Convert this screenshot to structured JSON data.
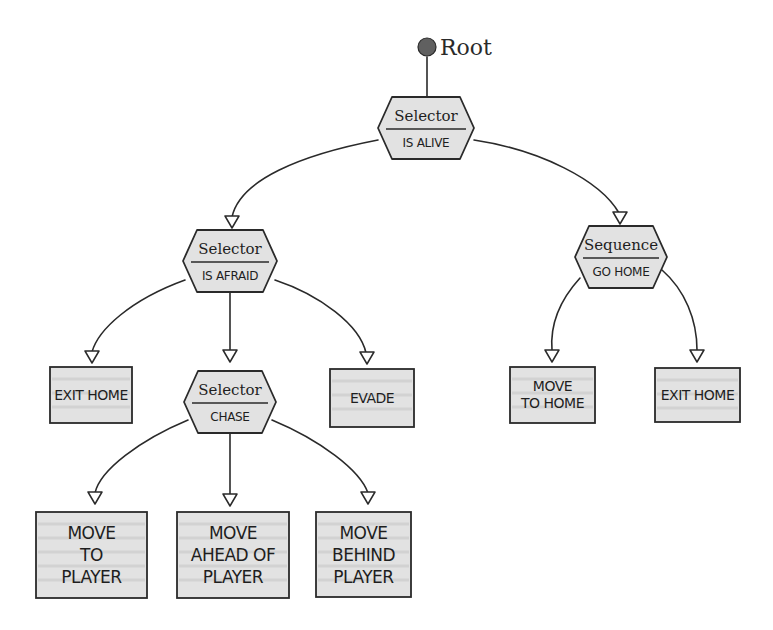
{
  "diagram": {
    "root": {
      "label": "Root",
      "x": 427,
      "y": 47
    },
    "colors": {
      "node_fill": "#e2e2e2",
      "stroke": "#2a2a2a",
      "root_dot": "#606060",
      "background": "#ffffff"
    },
    "nodes": [
      {
        "id": "n_alive",
        "shape": "hexagon",
        "type": "Selector",
        "condition": "IS ALIVE",
        "cx": 426,
        "cy": 128,
        "w": 96,
        "h": 62
      },
      {
        "id": "n_afraid",
        "shape": "hexagon",
        "type": "Selector",
        "condition": "IS AFRAID",
        "cx": 230,
        "cy": 261,
        "w": 94,
        "h": 62
      },
      {
        "id": "n_gohome",
        "shape": "hexagon",
        "type": "Sequence",
        "condition": "GO HOME",
        "cx": 621,
        "cy": 257,
        "w": 92,
        "h": 62
      },
      {
        "id": "n_exithome_l",
        "shape": "box",
        "lines": [
          "EXIT HOME"
        ],
        "x": 50,
        "y": 367,
        "w": 82,
        "h": 56,
        "size": "small"
      },
      {
        "id": "n_chase",
        "shape": "hexagon",
        "type": "Selector",
        "condition": "CHASE",
        "cx": 230,
        "cy": 402,
        "w": 92,
        "h": 62
      },
      {
        "id": "n_evade",
        "shape": "box",
        "lines": [
          "EVADE"
        ],
        "x": 330,
        "y": 369,
        "w": 84,
        "h": 58,
        "size": "small"
      },
      {
        "id": "n_movetohome",
        "shape": "box",
        "lines": [
          "MOVE",
          "TO HOME"
        ],
        "x": 510,
        "y": 367,
        "w": 85,
        "h": 56,
        "size": "small"
      },
      {
        "id": "n_exithome_r",
        "shape": "box",
        "lines": [
          "EXIT HOME"
        ],
        "x": 655,
        "y": 368,
        "w": 85,
        "h": 54,
        "size": "small"
      },
      {
        "id": "n_movetoplayer",
        "shape": "box",
        "lines": [
          "MOVE",
          "TO",
          "PLAYER"
        ],
        "x": 36,
        "y": 512,
        "w": 111,
        "h": 86,
        "size": "big"
      },
      {
        "id": "n_moveahead",
        "shape": "box",
        "lines": [
          "MOVE",
          "AHEAD OF",
          "PLAYER"
        ],
        "x": 177,
        "y": 512,
        "w": 112,
        "h": 86,
        "size": "big"
      },
      {
        "id": "n_movebehind",
        "shape": "box",
        "lines": [
          "MOVE",
          "BEHIND",
          "PLAYER"
        ],
        "x": 316,
        "y": 512,
        "w": 95,
        "h": 85,
        "size": "big"
      }
    ],
    "edges": [
      {
        "from": "root",
        "to": "n_alive",
        "path": "M427,57 L427,96",
        "arrow": null
      },
      {
        "from": "n_alive",
        "to": "n_afraid",
        "path": "M378,140 C300,155 240,180 232,217",
        "arrow": [
          232,
          222
        ]
      },
      {
        "from": "n_alive",
        "to": "n_gohome",
        "path": "M474,140 C540,150 600,180 619,213",
        "arrow": [
          620,
          218
        ]
      },
      {
        "from": "n_afraid",
        "to": "n_exithome_l",
        "path": "M185,280 C130,300 98,330 92,352",
        "arrow": [
          92,
          357
        ]
      },
      {
        "from": "n_afraid",
        "to": "n_chase",
        "path": "M230,292 L230,350",
        "arrow": [
          230,
          356
        ]
      },
      {
        "from": "n_afraid",
        "to": "n_evade",
        "path": "M275,280 C320,295 360,325 366,353",
        "arrow": [
          367,
          358
        ]
      },
      {
        "from": "n_gohome",
        "to": "n_movetohome",
        "path": "M580,278 C560,300 550,325 552,350",
        "arrow": [
          552,
          356
        ]
      },
      {
        "from": "n_gohome",
        "to": "n_exithome_r",
        "path": "M662,270 C685,290 697,320 697,350",
        "arrow": [
          697,
          356
        ]
      },
      {
        "from": "n_chase",
        "to": "n_movetoplayer",
        "path": "M188,420 C140,440 100,470 95,493",
        "arrow": [
          95,
          498
        ]
      },
      {
        "from": "n_chase",
        "to": "n_moveahead",
        "path": "M230,433 L230,494",
        "arrow": [
          230,
          500
        ]
      },
      {
        "from": "n_chase",
        "to": "n_movebehind",
        "path": "M272,420 C320,440 360,470 368,493",
        "arrow": [
          368,
          498
        ]
      }
    ]
  }
}
